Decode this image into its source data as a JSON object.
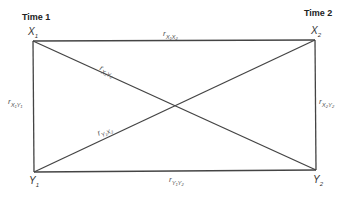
{
  "diagram": {
    "type": "cross-lagged panel diagram",
    "time_labels": {
      "left": "Time 1",
      "right": "Time 2"
    },
    "nodes": {
      "x1": {
        "base": "X",
        "sub": "1"
      },
      "x2": {
        "base": "X",
        "sub": "2"
      },
      "y1": {
        "base": "Y",
        "sub": "1"
      },
      "y2": {
        "base": "Y",
        "sub": "2"
      }
    },
    "edges": {
      "top": {
        "r": "r",
        "sub": "X₁X₂"
      },
      "bottom": {
        "r": "r",
        "sub": "Y₁Y₂"
      },
      "left": {
        "r": "r",
        "sub": "X₁Y₁"
      },
      "right": {
        "r": "r",
        "sub": "X₂Y₂"
      },
      "diag_down": {
        "r": "r",
        "sub": "X₁Y₂"
      },
      "diag_up": {
        "r": "r",
        "sub": "Y₁X₂"
      }
    },
    "line_color": "#444444"
  }
}
